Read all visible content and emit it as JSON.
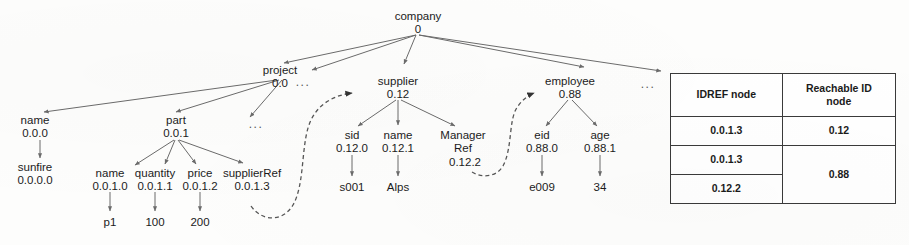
{
  "diagram": {
    "title_visible": false,
    "type": "xml-id-idref-tree",
    "nodes": {
      "root": {
        "label": "company",
        "id": "0"
      },
      "project": {
        "label": "project",
        "id": "0.0"
      },
      "supplier": {
        "label": "supplier",
        "id": "0.12"
      },
      "employee": {
        "label": "employee",
        "id": "0.88"
      },
      "proj_name": {
        "label": "name",
        "id": "0.0.0"
      },
      "part": {
        "label": "part",
        "id": "0.0.1"
      },
      "sunfire": {
        "label": "sunfire",
        "id": "0.0.0.0"
      },
      "part_name": {
        "label": "name",
        "id": "0.0.1.0"
      },
      "quantity": {
        "label": "quantity",
        "id": "0.0.1.1"
      },
      "price": {
        "label": "price",
        "id": "0.0.1.2"
      },
      "supplierRef": {
        "label": "supplierRef",
        "id": "0.0.1.3"
      },
      "p1": {
        "label": "p1",
        "id": ""
      },
      "q100": {
        "label": "100",
        "id": ""
      },
      "p200": {
        "label": "200",
        "id": ""
      },
      "sid": {
        "label": "sid",
        "id": "0.12.0"
      },
      "sup_name": {
        "label": "name",
        "id": "0.12.1"
      },
      "managerRef": {
        "label": "Manager",
        "label2": "Ref",
        "id": "0.12.2"
      },
      "s001": {
        "label": "s001",
        "id": ""
      },
      "alps": {
        "label": "Alps",
        "id": ""
      },
      "eid": {
        "label": "eid",
        "id": "0.88.0"
      },
      "age": {
        "label": "age",
        "id": "0.88.1"
      },
      "e009": {
        "label": "e009",
        "id": ""
      },
      "age34": {
        "label": "34",
        "id": ""
      }
    },
    "ellipses": {
      "under_root_left": "...",
      "under_root_right": "...",
      "under_project": "..."
    },
    "ref_edges": [
      {
        "from": "0.0.1.3",
        "to": "0.12"
      },
      {
        "from": "0.12.2",
        "to": "0.88"
      }
    ],
    "colors": {
      "edge": "#6b6b6b",
      "ref_edge": "#555555",
      "text": "#1b1b1b",
      "table_border": "#3a3a3a",
      "background": "#fdfdfc"
    }
  },
  "table": {
    "headers": [
      "IDREF node",
      "Reachable ID node"
    ],
    "header_lines": [
      [
        "IDREF node"
      ],
      [
        "Reachable ID",
        "node"
      ]
    ],
    "rows": [
      {
        "idref": "0.0.1.3",
        "reachable": "0.12"
      },
      {
        "idref": "0.0.1.3",
        "reachable": "0.88"
      },
      {
        "idref": "0.12.2",
        "reachable": ""
      }
    ],
    "merged_reachable_value": "0.88",
    "merged_rowspan": 2
  }
}
